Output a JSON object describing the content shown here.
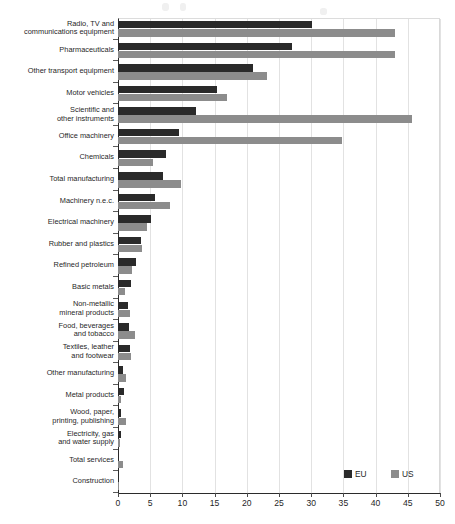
{
  "chart_data": {
    "type": "bar",
    "orientation": "horizontal",
    "title": "",
    "xlabel": "",
    "ylabel": "",
    "xlim": [
      0,
      50
    ],
    "xticks": [
      0,
      5,
      10,
      15,
      20,
      25,
      30,
      35,
      40,
      45,
      50
    ],
    "grid": true,
    "legend_position": "bottom-right",
    "categories": [
      "Radio, TV and communications equipment",
      "Pharmaceuticals",
      "Other transport equipment",
      "Motor vehicles",
      "Scientific and other instruments",
      "Office machinery",
      "Chemicals",
      "Total manufacturing",
      "Machinery n.e.c.",
      "Electrical machinery",
      "Rubber and plastics",
      "Refined petroleum",
      "Basic metals",
      "Non-metallic mineral products",
      "Food, beverages and tobacco",
      "Textiles, leather and footwear",
      "Other manufacturing",
      "Metal products",
      "Wood, paper, printing, publishing",
      "Electricity, gas and water supply",
      "Total services",
      "Construction"
    ],
    "category_lines": [
      [
        "Radio, TV and",
        "communications equipment"
      ],
      [
        "Pharmaceuticals"
      ],
      [
        "Other transport equipment"
      ],
      [
        "Motor vehicles"
      ],
      [
        "Scientific and",
        "other instruments"
      ],
      [
        "Office machinery"
      ],
      [
        "Chemicals"
      ],
      [
        "Total manufacturing"
      ],
      [
        "Machinery n.e.c."
      ],
      [
        "Electrical machinery"
      ],
      [
        "Rubber and plastics"
      ],
      [
        "Refined petroleum"
      ],
      [
        "Basic metals"
      ],
      [
        "Non-metallic",
        "mineral products"
      ],
      [
        "Food, beverages",
        "and tobacco"
      ],
      [
        "Textiles, leather",
        "and footwear"
      ],
      [
        "Other manufacturing"
      ],
      [
        "Metal products"
      ],
      [
        "Wood, paper,",
        "printing, publishing"
      ],
      [
        "Electricity, gas",
        "and water supply"
      ],
      [
        "Total services"
      ],
      [
        "Construction"
      ]
    ],
    "series": [
      {
        "name": "EU",
        "color": "#2a2a2a",
        "values": [
          30.2,
          27.0,
          21.0,
          15.4,
          12.1,
          9.4,
          7.5,
          7.0,
          5.8,
          5.1,
          3.5,
          2.8,
          2.0,
          1.6,
          1.7,
          1.9,
          0.85,
          1.0,
          0.5,
          0.4,
          0.2,
          0.1
        ]
      },
      {
        "name": "US",
        "color": "#8c8c8c",
        "values": [
          43.0,
          43.0,
          23.2,
          17.0,
          45.6,
          34.8,
          5.4,
          9.8,
          8.0,
          4.5,
          3.8,
          2.2,
          1.05,
          1.9,
          2.6,
          2.0,
          1.2,
          0.4,
          1.3,
          0.3,
          0.8,
          0.05
        ]
      }
    ]
  },
  "legend": {
    "items": [
      {
        "label": "EU",
        "color": "#2a2a2a"
      },
      {
        "label": "US",
        "color": "#8c8c8c"
      }
    ]
  },
  "axis": {
    "tick_labels": [
      "0",
      "5",
      "10",
      "15",
      "20",
      "25",
      "30",
      "35",
      "40",
      "45",
      "50"
    ]
  }
}
